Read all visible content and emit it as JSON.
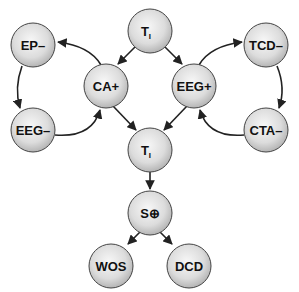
{
  "diagram": {
    "type": "flow",
    "nodes": [
      {
        "id": "ti_top",
        "label": "T",
        "sub": "I",
        "x": 150,
        "y": 31
      },
      {
        "id": "ep_neg",
        "label": "EP–",
        "x": 33,
        "y": 45
      },
      {
        "id": "tcd_neg",
        "label": "TCD–",
        "x": 266,
        "y": 45
      },
      {
        "id": "ca_pos",
        "label": "CA+",
        "x": 106,
        "y": 86
      },
      {
        "id": "eeg_pos",
        "label": "EEG+",
        "x": 194,
        "y": 86
      },
      {
        "id": "eeg_neg",
        "label": "EEG–",
        "x": 33,
        "y": 130
      },
      {
        "id": "cta_neg",
        "label": "CTA–",
        "x": 266,
        "y": 130
      },
      {
        "id": "ti_mid",
        "label": "T",
        "sub": "I",
        "x": 150,
        "y": 150
      },
      {
        "id": "s_pos",
        "label": "S",
        "symbol": "⊕",
        "x": 150,
        "y": 213
      },
      {
        "id": "wos",
        "label": "WOS",
        "x": 111,
        "y": 266
      },
      {
        "id": "dcd",
        "label": "DCD",
        "x": 189,
        "y": 266
      }
    ],
    "edges": [
      {
        "from": "ti_top",
        "to": "ca_pos"
      },
      {
        "from": "ti_top",
        "to": "eeg_pos"
      },
      {
        "from": "ca_pos",
        "to": "ep_neg",
        "curved": true
      },
      {
        "from": "ep_neg",
        "to": "eeg_neg",
        "curved": true
      },
      {
        "from": "eeg_neg",
        "to": "ca_pos",
        "curved": true
      },
      {
        "from": "eeg_pos",
        "to": "tcd_neg",
        "curved": true
      },
      {
        "from": "tcd_neg",
        "to": "cta_neg",
        "curved": true
      },
      {
        "from": "cta_neg",
        "to": "eeg_pos",
        "curved": true
      },
      {
        "from": "ca_pos",
        "to": "ti_mid"
      },
      {
        "from": "eeg_pos",
        "to": "ti_mid"
      },
      {
        "from": "ti_mid",
        "to": "s_pos"
      },
      {
        "from": "s_pos",
        "to": "wos"
      },
      {
        "from": "s_pos",
        "to": "dcd"
      }
    ],
    "colors": {
      "node_fill_center": "#f4f4f4",
      "node_fill_edge": "#b8b8b8",
      "stroke": "#333333",
      "text": "#111111"
    }
  },
  "labels": {
    "ti_top": "T",
    "ti_top_sub": "I",
    "ep_neg": "EP–",
    "tcd_neg": "TCD–",
    "ca_pos": "CA+",
    "eeg_pos": "EEG+",
    "eeg_neg": "EEG–",
    "cta_neg": "CTA–",
    "ti_mid": "T",
    "ti_mid_sub": "I",
    "s_pos": "S",
    "s_pos_symbol": "⊕",
    "wos": "WOS",
    "dcd": "DCD"
  }
}
